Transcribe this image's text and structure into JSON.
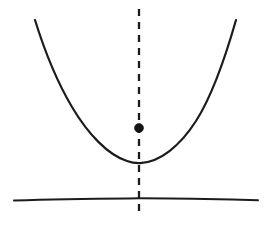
{
  "figure": {
    "background_color": "#ffffff",
    "ink_color": "#1c1c1c",
    "width": 272,
    "height": 225,
    "style": "hand-drawn line diagram, no labels or text"
  },
  "elements": {
    "parabola": {
      "name": "parabola-curve",
      "description": "upward-opening hand-drawn parabola",
      "color": "#1c1c1c",
      "stroke_width": 2.2,
      "vertex": {
        "x": 138,
        "y": 163
      },
      "left_endpoint": {
        "x": 35,
        "y": 20
      },
      "right_endpoint": {
        "x": 236,
        "y": 20
      },
      "path": "M 35,20 C 44,49 56,80 72,107 C 88,134 108,155 127,161 C 131,162.5 136,163.2 140,163.1 C 160,162 180,146 196,121 C 212,96 224,62 236,20"
    },
    "axis_of_symmetry": {
      "name": "axis-of-symmetry-dashed-line",
      "description": "vertical dashed line through the vertex",
      "color": "#1c1c1c",
      "stroke_width": 2.3,
      "dash_length": 7,
      "gap_length": 6,
      "x": 139,
      "y_start": 9,
      "y_end": 212
    },
    "directrix": {
      "name": "directrix-horizontal-line",
      "description": "slightly wavy horizontal line below the vertex",
      "color": "#1c1c1c",
      "stroke_width": 2.0,
      "y": 199,
      "x_start": 14,
      "x_end": 258,
      "path": "M 14,200.5 C 50,199.2 90,198.6 128,198.4 C 160,198.2 200,198.9 232,199.6 C 243,199.9 251,200.1 258,200.3"
    },
    "focus_point": {
      "name": "focus-point-dot",
      "description": "solid filled dot on the axis of symmetry above the vertex",
      "color": "#141414",
      "center": {
        "x": 139,
        "y": 128
      },
      "radius": 4.5
    }
  },
  "chart_data": {
    "type": "line",
    "xlabel": "",
    "ylabel": "",
    "grid": false,
    "legend": null,
    "xlim": [
      14,
      258
    ],
    "ylim": [
      225,
      0
    ],
    "series": [
      {
        "name": "parabola",
        "style": "solid",
        "x": [
          35,
          56,
          72,
          90,
          110,
          127,
          139,
          152,
          170,
          186,
          200,
          216,
          236
        ],
        "y": [
          20,
          80,
          107,
          135,
          153,
          161,
          163,
          161,
          152,
          133,
          113,
          83,
          20
        ]
      },
      {
        "name": "axis-of-symmetry",
        "style": "dashed",
        "x": [
          139,
          139
        ],
        "y": [
          9,
          212
        ]
      },
      {
        "name": "directrix",
        "style": "solid",
        "x": [
          14,
          128,
          200,
          258
        ],
        "y": [
          200.5,
          198.4,
          198.9,
          200.3
        ]
      }
    ],
    "points": [
      {
        "name": "focus",
        "x": 139,
        "y": 128,
        "marker": "filled-circle"
      },
      {
        "name": "vertex",
        "x": 138,
        "y": 163,
        "marker": "none"
      }
    ],
    "annotations": []
  }
}
